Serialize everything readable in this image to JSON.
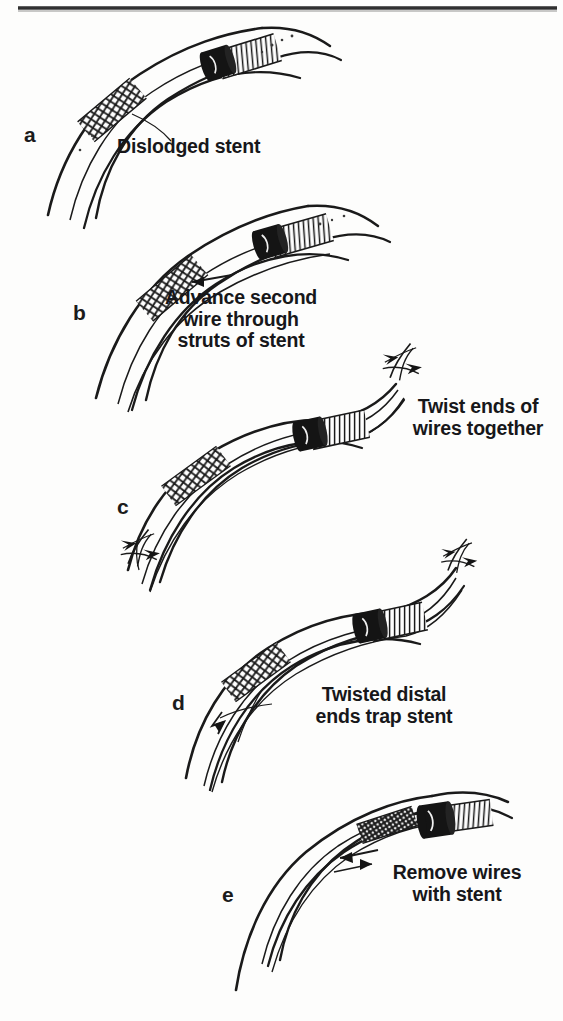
{
  "figure": {
    "panel_count": 5,
    "ink_color": "#1a1a1a",
    "background_color": "#fdfdfc"
  },
  "panels": [
    {
      "letter": "a",
      "caption": "Dislodged stent",
      "caption_align": "left",
      "has_leader_line": true,
      "leader_target": "stent-mesh"
    },
    {
      "letter": "b",
      "caption": "Advance second\nwire through\nstruts of stent",
      "caption_align": "center",
      "has_leader_line": false,
      "leader_target": ""
    },
    {
      "letter": "c",
      "caption": "Twist ends of\nwires together",
      "caption_align": "center",
      "has_leader_line": false,
      "leader_target": ""
    },
    {
      "letter": "d",
      "caption": "Twisted distal\nends trap stent",
      "caption_align": "center",
      "has_leader_line": true,
      "leader_target": "twisted-wire-end"
    },
    {
      "letter": "e",
      "caption": "Remove wires\nwith stent",
      "caption_align": "center",
      "has_leader_line": false,
      "leader_target": ""
    }
  ]
}
